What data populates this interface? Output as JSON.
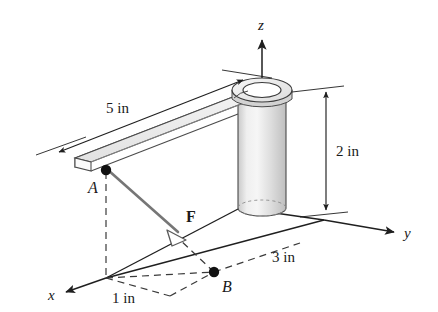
{
  "figure": {
    "background_color": "#ffffff",
    "line_color": "#1f1f1f",
    "dash_color": "#3a3a3a",
    "beam_top_color": "#ececec",
    "beam_side_color": "#bdbdbd",
    "beam_end_color": "#fbfbfb",
    "cylinder_color": "#d9d9d9",
    "cylinder_highlight_color": "#f2f2f2",
    "hub_top_color": "#efefef",
    "force_color": "#6e6e6e"
  },
  "axes": {
    "x": {
      "label": "x",
      "direction": "down-left"
    },
    "y": {
      "label": "y",
      "direction": "right"
    },
    "z": {
      "label": "z",
      "direction": "up"
    }
  },
  "points": [
    {
      "name": "A",
      "label": "A",
      "role": "force-application-point",
      "marker": "filled-dot"
    },
    {
      "name": "B",
      "label": "B",
      "role": "force-target-point",
      "marker": "filled-dot"
    }
  ],
  "vectors": [
    {
      "name": "F",
      "label": "F",
      "from": "A",
      "to": "B",
      "arrowhead": "hollow-triangle"
    }
  ],
  "dimensions": [
    {
      "name": "beam-length",
      "label": "5 in",
      "value": 5,
      "unit": "in",
      "arrows": "double"
    },
    {
      "name": "cylinder-height",
      "label": "2 in",
      "value": 2,
      "unit": "in",
      "arrows": "double"
    },
    {
      "name": "y-offset-to-B",
      "label": "3 in",
      "value": 3,
      "unit": "in",
      "arrows": "none"
    },
    {
      "name": "x-offset-to-B",
      "label": "1 in",
      "value": 1,
      "unit": "in",
      "arrows": "none"
    }
  ]
}
